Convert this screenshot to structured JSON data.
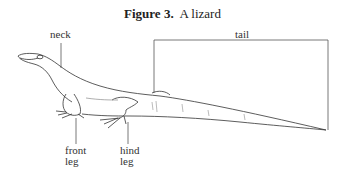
{
  "figure": {
    "number_label": "Figure 3.",
    "caption": "A lizard"
  },
  "labels": {
    "neck": "neck",
    "tail": "tail",
    "front_leg_line1": "front",
    "front_leg_line2": "leg",
    "hind_leg_line1": "hind",
    "hind_leg_line2": "leg"
  }
}
